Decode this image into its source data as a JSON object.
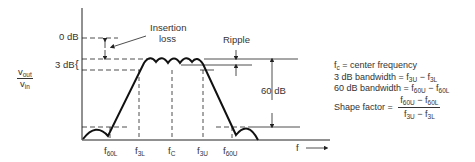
{
  "diagram": {
    "y_axis_label_num": "v",
    "y_axis_label_num_sub": "out",
    "y_axis_label_den": "v",
    "y_axis_label_den_sub": "in",
    "x_axis_label": "f",
    "level_0db": "0 dB",
    "level_3db": "3 dB",
    "insertion_loss": "Insertion",
    "insertion_loss_2": "loss",
    "ripple": "Ripple",
    "level_60db": "60 dB",
    "ticks": [
      {
        "main": "f",
        "sub": "60L"
      },
      {
        "main": "f",
        "sub": "3L"
      },
      {
        "main": "f",
        "sub": "C"
      },
      {
        "main": "f",
        "sub": "3U"
      },
      {
        "main": "f",
        "sub": "60U"
      }
    ]
  },
  "legend": {
    "line1_main": "f",
    "line1_sub": "c",
    "line1_rest": " = center frequency",
    "line2_pre": "3 dB bandwidth = f",
    "line2_sub1": "3U",
    "line2_mid": " − f",
    "line2_sub2": "3L",
    "line3_pre": "60 dB bandwidth = f",
    "line3_sub1": "60U",
    "line3_mid": " − f",
    "line3_sub2": "60L",
    "line4_pre": "Shape factor = ",
    "num_a": "f",
    "num_a_sub": "60U",
    "num_mid": " − f",
    "num_b_sub": "60L",
    "den_a": "f",
    "den_a_sub": "3U",
    "den_mid": " − f",
    "den_b_sub": "3L"
  }
}
